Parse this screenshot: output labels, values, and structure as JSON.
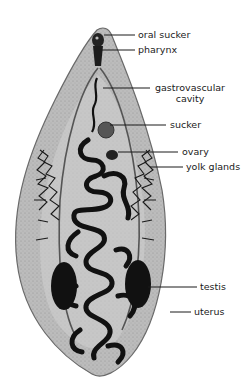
{
  "figure": {
    "colors": {
      "body_fill": "#b9b9b9",
      "body_edge": "#6a6a6a",
      "organ_dark": "#111111",
      "background": "#ffffff",
      "leader_line": "#1a1a1a"
    }
  },
  "labels": [
    {
      "id": "oral-sucker",
      "text": "oral sucker"
    },
    {
      "id": "pharynx",
      "text": "pharynx"
    },
    {
      "id": "gastrovascular-cavity",
      "line1": "gastrovascular",
      "line2": "cavity"
    },
    {
      "id": "sucker",
      "text": "sucker"
    },
    {
      "id": "ovary",
      "text": "ovary"
    },
    {
      "id": "yolk-glands",
      "text": "yolk glands"
    },
    {
      "id": "testis",
      "text": "testis"
    },
    {
      "id": "uterus",
      "text": "uterus"
    }
  ]
}
